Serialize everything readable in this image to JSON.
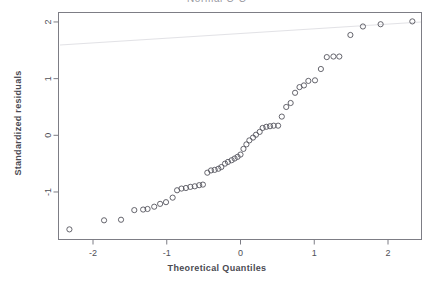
{
  "window": {
    "app_name": "R Graphics Device",
    "background_color": "#ffffff"
  },
  "chart_data": {
    "type": "scatter",
    "title": "Normal Q-Q",
    "xlabel": "Theoretical Quantiles",
    "ylabel": "Standardized residuals",
    "xlim": [
      -2.5,
      2.45
    ],
    "ylim": [
      -1.75,
      2.15
    ],
    "xticks": [
      -2,
      -1,
      0,
      1,
      2
    ],
    "xticklabels": [
      "-2",
      "-1",
      "0",
      "1",
      "2"
    ],
    "yticks": [
      -1,
      0,
      1,
      2
    ],
    "yticklabels": [
      "-1",
      "0",
      "1",
      "2"
    ],
    "grid": false,
    "legend": false,
    "marker": "open-circle",
    "marker_color": "#55555d",
    "frame_color": "#7d7d85",
    "n_points": 50,
    "x": [
      -2.32,
      -1.85,
      -1.62,
      -1.44,
      -1.32,
      -1.26,
      -1.17,
      -1.09,
      -1.01,
      -0.92,
      -0.86,
      -0.8,
      -0.74,
      -0.68,
      -0.62,
      -0.56,
      -0.51,
      -0.45,
      -0.4,
      -0.35,
      -0.3,
      -0.26,
      -0.21,
      -0.17,
      -0.12,
      -0.08,
      -0.04,
      0.0,
      0.04,
      0.08,
      0.12,
      0.17,
      0.21,
      0.26,
      0.3,
      0.35,
      0.4,
      0.45,
      0.51,
      0.56,
      0.62,
      0.68,
      0.74,
      0.8,
      0.86,
      0.92,
      1.01,
      1.09,
      1.17,
      1.26,
      1.34,
      1.49,
      1.66,
      1.9,
      2.33
    ],
    "y": [
      -1.66,
      -1.5,
      -1.49,
      -1.32,
      -1.31,
      -1.3,
      -1.26,
      -1.21,
      -1.18,
      -1.1,
      -0.97,
      -0.94,
      -0.93,
      -0.91,
      -0.9,
      -0.88,
      -0.87,
      -0.66,
      -0.62,
      -0.61,
      -0.59,
      -0.56,
      -0.5,
      -0.47,
      -0.44,
      -0.41,
      -0.38,
      -0.34,
      -0.24,
      -0.16,
      -0.09,
      -0.04,
      0.01,
      0.06,
      0.13,
      0.15,
      0.16,
      0.17,
      0.17,
      0.33,
      0.5,
      0.57,
      0.75,
      0.85,
      0.88,
      0.96,
      0.97,
      1.17,
      1.38,
      1.39,
      1.39,
      1.77,
      1.92,
      1.96,
      2.01
    ]
  }
}
